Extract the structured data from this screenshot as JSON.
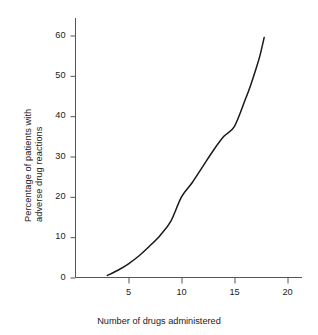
{
  "chart_data": {
    "type": "line",
    "title": "",
    "xlabel": "Number of drugs administered",
    "ylabel": "Percentage of patients with adverse drug reactions",
    "ylabel_lines": [
      "Percentage of patients with",
      "adverse drug reactions"
    ],
    "xlim": [
      0,
      21.5
    ],
    "ylim": [
      0,
      62
    ],
    "xticks": [
      5,
      10,
      15,
      20
    ],
    "xtick_labels": [
      "5",
      "10",
      "15",
      "20"
    ],
    "yticks": [
      0,
      10,
      20,
      30,
      40,
      50,
      60
    ],
    "ytick_labels": [
      "0",
      "10",
      "20",
      "30",
      "40",
      "50",
      "60"
    ],
    "grid": false,
    "legend": "none",
    "series": [
      {
        "name": "Adverse drug reactions",
        "color": "#1a1a1a",
        "x": [
          3.0,
          4.0,
          5.0,
          6.0,
          7.0,
          8.0,
          9.0,
          10.0,
          11.0,
          12.0,
          13.0,
          14.0,
          15.0,
          16.0,
          16.5,
          17.0,
          17.4,
          17.8
        ],
        "values": [
          0.5,
          1.8,
          3.4,
          5.4,
          7.8,
          10.5,
          14.0,
          20.0,
          23.5,
          27.5,
          31.5,
          35.0,
          37.5,
          44.0,
          47.5,
          51.5,
          55.0,
          59.5
        ]
      }
    ]
  },
  "axis_color": "#555555",
  "curve_color": "#1a1a1a",
  "background": "#ffffff"
}
